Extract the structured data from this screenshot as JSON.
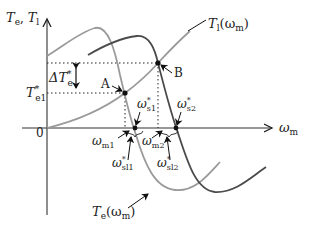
{
  "figure": {
    "y_axis_label": "T",
    "y_axis_label_sub1": "e",
    "y_axis_label_sep": ", ",
    "y_axis_label_sub2": "l",
    "x_axis_label": "ω",
    "x_axis_label_sub": "m",
    "origin_label": "0",
    "delta_label": "ΔT",
    "delta_label_sup": "*",
    "delta_label_sub": "e",
    "te1_label": "T",
    "te1_sup": "*",
    "te1_sub": "e1",
    "point_a_label": "A",
    "point_b_label": "B",
    "load_curve_label": "T",
    "load_curve_sub": "l",
    "load_curve_arg": "(ω",
    "load_curve_arg_sub": "m",
    "load_curve_close": ")",
    "torque_curve_label": "T",
    "torque_curve_sub": "e",
    "torque_curve_arg": "(ω",
    "torque_curve_arg_sub": "m",
    "torque_curve_close": ")",
    "ws1_label": "ω",
    "ws1_sup": "*",
    "ws1_sub": "s1",
    "ws2_label": "ω",
    "ws2_sup": "*",
    "ws2_sub": "s2",
    "wm1_label": "ω",
    "wm1_sub": "m1",
    "wm2_label": "ω",
    "wm2_sub": "m2",
    "wsl1_label": "ω",
    "wsl1_sup": "*",
    "wsl1_sub": "sl1",
    "wsl2_label": "ω",
    "wsl2_sup": "*",
    "wsl2_sub": "sl2"
  },
  "colors": {
    "axis": "#333333",
    "curve_light": "#9a9a9a",
    "curve_dark": "#4a4a4a",
    "load_curve": "#9a9a9a",
    "point": "#111111"
  }
}
